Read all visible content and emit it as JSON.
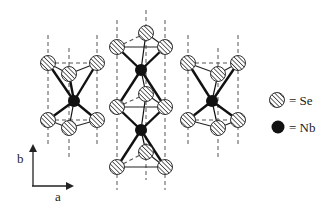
{
  "figure": {
    "colors": {
      "line": "#222222",
      "dashed": "#555555",
      "se_fill": "#ffffff",
      "hatch": "#333333",
      "nb_fill": "#111111"
    }
  },
  "legend": {
    "items": [
      {
        "symbol": "hatched-circle",
        "label": "= Se"
      },
      {
        "symbol": "filled-circle",
        "label": "= Nb"
      }
    ]
  },
  "axes": {
    "vertical_label": "b",
    "horizontal_label": "a"
  }
}
